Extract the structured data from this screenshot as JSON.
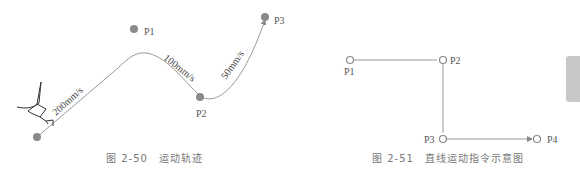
{
  "figure_50": {
    "caption": "图 2-50　运动轨迹",
    "points": {
      "start": "",
      "p1": "P1",
      "p2": "P2",
      "p3": "P3"
    },
    "speeds": {
      "seg1": "200mm/s",
      "seg2": "100mm/s",
      "seg3": "50mm/s"
    }
  },
  "figure_51": {
    "caption": "图 2-51　直线运动指令示意图",
    "points": {
      "p1": "P1",
      "p2": "P2",
      "p3": "P3",
      "p4": "P4"
    }
  },
  "colors": {
    "point_fill": "#8a8a8a",
    "line": "#999999",
    "text": "#555555",
    "caption": "#777777",
    "side_tab": "#c8c8c8"
  }
}
